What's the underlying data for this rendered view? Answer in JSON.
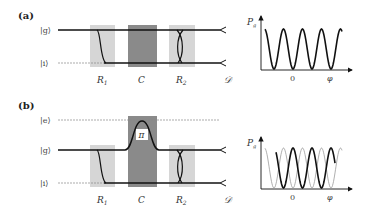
{
  "colors": {
    "ramsey_zone": "#d6d6d6",
    "cavity": "#8a8a8a",
    "line": "#111111",
    "dashed": "#888888",
    "ghost_curve": "#9a9a9a"
  },
  "panel_a": {
    "label": "(a)",
    "levels": [
      {
        "name": "g",
        "ket": "|g⟩"
      },
      {
        "name": "i",
        "ket": "|i⟩"
      }
    ],
    "zones": {
      "r1": "R",
      "r1_sub": "1",
      "cavity": "C",
      "r2": "R",
      "r2_sub": "2",
      "detector": "𝒟"
    },
    "plot": {
      "ylabel": "P",
      "ylabel_sub": "g",
      "xtick": "0",
      "xlabel": "φ"
    }
  },
  "panel_b": {
    "label": "(b)",
    "levels": [
      {
        "name": "e",
        "ket": "|e⟩"
      },
      {
        "name": "g",
        "ket": "|g⟩"
      },
      {
        "name": "i",
        "ket": "|i⟩"
      }
    ],
    "pulse_label": "π",
    "zones": {
      "r1": "R",
      "r1_sub": "1",
      "cavity": "C",
      "r2": "R",
      "r2_sub": "2",
      "detector": "𝒟"
    },
    "plot": {
      "ylabel": "P",
      "ylabel_sub": "g",
      "xtick": "0",
      "xlabel": "φ"
    }
  },
  "chart_data": [
    {
      "type": "line",
      "title": "(a) Ramsey fringes",
      "xlabel": "φ",
      "ylabel": "P_g",
      "xticks": [
        "0"
      ],
      "series": [
        {
          "name": "P_g(φ)",
          "style": "solid-bold",
          "function": "cosine fringes, 4 full periods, minimum at φ=0"
        }
      ],
      "grid": false
    },
    {
      "type": "line",
      "title": "(b) Ramsey fringes with π phase shift",
      "xlabel": "φ",
      "ylabel": "P_g",
      "xticks": [
        "0"
      ],
      "series": [
        {
          "name": "P_g(φ) shifted",
          "style": "solid-bold",
          "function": "cosine fringes, maximum at φ=0"
        },
        {
          "name": "P_g(φ) reference",
          "style": "thin-gray",
          "function": "cosine fringes, minimum at φ=0"
        }
      ],
      "grid": false
    }
  ]
}
